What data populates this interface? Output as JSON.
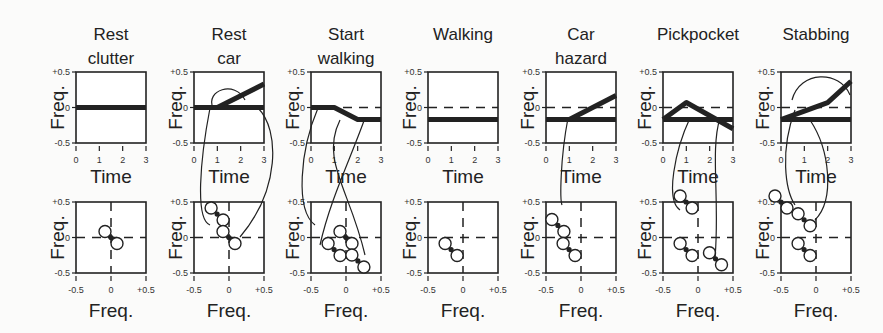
{
  "figure": {
    "panels": [
      {
        "title_line1": "Rest",
        "title_line2": "clutter"
      },
      {
        "title_line1": "Rest",
        "title_line2": "car"
      },
      {
        "title_line1": "Start",
        "title_line2": "walking"
      },
      {
        "title_line1": "Walking",
        "title_line2": ""
      },
      {
        "title_line1": "Car",
        "title_line2": "hazard"
      },
      {
        "title_line1": "Pickpocket",
        "title_line2": ""
      },
      {
        "title_line1": "Stabbing",
        "title_line2": ""
      }
    ],
    "top_axes": {
      "xlabel": "Time",
      "ylabel": "Freq.",
      "xticks": [
        "0",
        "1",
        "2",
        "3"
      ],
      "yticks": [
        "+0.5",
        "0",
        "-0.5"
      ]
    },
    "bottom_axes": {
      "xlabel": "Freq.",
      "ylabel": "Freq.",
      "xticks": [
        "-0.5",
        "0",
        "+0.5"
      ],
      "yticks": [
        "+0.5",
        "0",
        "-0.5"
      ]
    }
  },
  "chart_data": [
    {
      "type": "line",
      "title": "Rest clutter",
      "xlabel": "Time",
      "ylabel": "Freq.",
      "xlim": [
        0,
        3
      ],
      "ylim": [
        -0.5,
        0.5
      ],
      "series": [
        {
          "name": "track1",
          "x": [
            0,
            3
          ],
          "y": [
            0,
            0
          ]
        }
      ]
    },
    {
      "type": "line",
      "title": "Rest car",
      "xlabel": "Time",
      "ylabel": "Freq.",
      "xlim": [
        0,
        3
      ],
      "ylim": [
        -0.5,
        0.5
      ],
      "series": [
        {
          "name": "track1",
          "x": [
            0,
            3
          ],
          "y": [
            0,
            0
          ]
        },
        {
          "name": "track2",
          "x": [
            1,
            3
          ],
          "y": [
            0,
            0.33
          ]
        }
      ]
    },
    {
      "type": "line",
      "title": "Start walking",
      "xlabel": "Time",
      "ylabel": "Freq.",
      "xlim": [
        0,
        3
      ],
      "ylim": [
        -0.5,
        0.5
      ],
      "series": [
        {
          "name": "track1",
          "x": [
            0,
            1,
            2,
            3
          ],
          "y": [
            0,
            0,
            -0.17,
            -0.17
          ]
        }
      ]
    },
    {
      "type": "line",
      "title": "Walking",
      "xlabel": "Time",
      "ylabel": "Freq.",
      "xlim": [
        0,
        3
      ],
      "ylim": [
        -0.5,
        0.5
      ],
      "series": [
        {
          "name": "track1",
          "x": [
            0,
            3
          ],
          "y": [
            -0.17,
            -0.17
          ]
        }
      ]
    },
    {
      "type": "line",
      "title": "Car hazard",
      "xlabel": "Time",
      "ylabel": "Freq.",
      "xlim": [
        0,
        3
      ],
      "ylim": [
        -0.5,
        0.5
      ],
      "series": [
        {
          "name": "track1",
          "x": [
            0,
            3
          ],
          "y": [
            -0.17,
            -0.17
          ]
        },
        {
          "name": "track2",
          "x": [
            1,
            3
          ],
          "y": [
            -0.17,
            0.17
          ]
        }
      ]
    },
    {
      "type": "line",
      "title": "Pickpocket",
      "xlabel": "Time",
      "ylabel": "Freq.",
      "xlim": [
        0,
        3
      ],
      "ylim": [
        -0.5,
        0.5
      ],
      "series": [
        {
          "name": "track1",
          "x": [
            0,
            3
          ],
          "y": [
            -0.17,
            -0.17
          ]
        },
        {
          "name": "track2",
          "x": [
            0,
            1,
            3
          ],
          "y": [
            -0.17,
            0.07,
            -0.3
          ]
        }
      ]
    },
    {
      "type": "line",
      "title": "Stabbing",
      "xlabel": "Time",
      "ylabel": "Freq.",
      "xlim": [
        0,
        3
      ],
      "ylim": [
        -0.5,
        0.5
      ],
      "series": [
        {
          "name": "track1",
          "x": [
            0,
            3
          ],
          "y": [
            -0.17,
            -0.17
          ]
        },
        {
          "name": "track2",
          "x": [
            0,
            2,
            3
          ],
          "y": [
            -0.17,
            0.07,
            0.37
          ]
        }
      ]
    }
  ]
}
